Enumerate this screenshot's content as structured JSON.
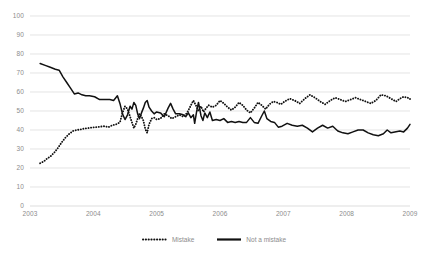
{
  "chart_data": {
    "type": "line",
    "title": "",
    "xlabel": "",
    "ylabel": "",
    "ylim": [
      0,
      100
    ],
    "xlim": [
      2003.0,
      2009.0
    ],
    "ytick_labels": [
      "100",
      "90",
      "80",
      "70",
      "60",
      "50",
      "40",
      "30",
      "20",
      "10",
      "0"
    ],
    "ytick_values": [
      100,
      90,
      80,
      70,
      60,
      50,
      40,
      30,
      20,
      10,
      0
    ],
    "xtick_labels": [
      "2003",
      "2004",
      "2005",
      "2006",
      "2007",
      "2008",
      "2009"
    ],
    "xtick_values": [
      2003,
      2004,
      2005,
      2006,
      2007,
      2008,
      2009
    ],
    "grid": "horizontal",
    "legend_position": "bottom-center",
    "series": [
      {
        "name": "Mistake",
        "style": "dotted",
        "color": "#111111",
        "points": [
          [
            2003.16,
            22.5
          ],
          [
            2003.22,
            23.5
          ],
          [
            2003.27,
            25.0
          ],
          [
            2003.32,
            26.0
          ],
          [
            2003.38,
            28.0
          ],
          [
            2003.44,
            30.5
          ],
          [
            2003.5,
            33.5
          ],
          [
            2003.56,
            36.0
          ],
          [
            2003.62,
            38.0
          ],
          [
            2003.68,
            39.5
          ],
          [
            2003.74,
            40.0
          ],
          [
            2003.8,
            40.3
          ],
          [
            2003.86,
            40.8
          ],
          [
            2003.92,
            41.0
          ],
          [
            2003.98,
            41.3
          ],
          [
            2004.05,
            41.5
          ],
          [
            2004.12,
            41.8
          ],
          [
            2004.18,
            42.0
          ],
          [
            2004.24,
            41.5
          ],
          [
            2004.3,
            42.5
          ],
          [
            2004.36,
            43.0
          ],
          [
            2004.42,
            44.0
          ],
          [
            2004.46,
            49.0
          ],
          [
            2004.5,
            52.5
          ],
          [
            2004.54,
            51.0
          ],
          [
            2004.58,
            47.0
          ],
          [
            2004.61,
            44.0
          ],
          [
            2004.64,
            41.0
          ],
          [
            2004.67,
            43.0
          ],
          [
            2004.7,
            46.0
          ],
          [
            2004.73,
            48.5
          ],
          [
            2004.76,
            47.0
          ],
          [
            2004.79,
            45.0
          ],
          [
            2004.82,
            40.5
          ],
          [
            2004.85,
            38.5
          ],
          [
            2004.88,
            43.0
          ],
          [
            2004.92,
            46.0
          ],
          [
            2004.96,
            46.5
          ],
          [
            2005.0,
            45.5
          ],
          [
            2005.06,
            46.0
          ],
          [
            2005.12,
            48.5
          ],
          [
            2005.18,
            47.5
          ],
          [
            2005.24,
            46.0
          ],
          [
            2005.3,
            47.0
          ],
          [
            2005.36,
            48.0
          ],
          [
            2005.42,
            47.0
          ],
          [
            2005.48,
            49.0
          ],
          [
            2005.54,
            53.0
          ],
          [
            2005.58,
            55.5
          ],
          [
            2005.62,
            53.0
          ],
          [
            2005.66,
            50.0
          ],
          [
            2005.7,
            52.5
          ],
          [
            2005.74,
            49.5
          ],
          [
            2005.78,
            51.5
          ],
          [
            2005.82,
            53.0
          ],
          [
            2005.88,
            52.0
          ],
          [
            2005.94,
            53.0
          ],
          [
            2006.0,
            55.5
          ],
          [
            2006.06,
            54.0
          ],
          [
            2006.12,
            52.0
          ],
          [
            2006.18,
            50.5
          ],
          [
            2006.24,
            52.0
          ],
          [
            2006.3,
            54.5
          ],
          [
            2006.36,
            53.0
          ],
          [
            2006.42,
            50.5
          ],
          [
            2006.48,
            49.0
          ],
          [
            2006.54,
            51.5
          ],
          [
            2006.6,
            54.5
          ],
          [
            2006.66,
            53.0
          ],
          [
            2006.72,
            51.0
          ],
          [
            2006.78,
            53.5
          ],
          [
            2006.84,
            55.0
          ],
          [
            2006.9,
            54.5
          ],
          [
            2006.96,
            53.5
          ],
          [
            2007.02,
            55.0
          ],
          [
            2007.1,
            56.5
          ],
          [
            2007.18,
            55.5
          ],
          [
            2007.26,
            54.0
          ],
          [
            2007.34,
            56.5
          ],
          [
            2007.42,
            58.5
          ],
          [
            2007.5,
            57.0
          ],
          [
            2007.58,
            55.0
          ],
          [
            2007.66,
            53.5
          ],
          [
            2007.74,
            55.5
          ],
          [
            2007.82,
            57.0
          ],
          [
            2007.9,
            56.0
          ],
          [
            2007.98,
            55.0
          ],
          [
            2008.06,
            56.0
          ],
          [
            2008.14,
            57.0
          ],
          [
            2008.22,
            56.0
          ],
          [
            2008.3,
            55.0
          ],
          [
            2008.38,
            54.0
          ],
          [
            2008.46,
            55.5
          ],
          [
            2008.54,
            58.5
          ],
          [
            2008.62,
            58.0
          ],
          [
            2008.7,
            56.5
          ],
          [
            2008.78,
            55.0
          ],
          [
            2008.84,
            56.5
          ],
          [
            2008.9,
            57.5
          ],
          [
            2008.96,
            57.0
          ],
          [
            2009.0,
            56.5
          ],
          [
            2009.0,
            56.0
          ]
        ]
      },
      {
        "name": "Not a mistake",
        "style": "solid",
        "color": "#111111",
        "points": [
          [
            2003.16,
            75.0
          ],
          [
            2003.24,
            74.0
          ],
          [
            2003.32,
            73.0
          ],
          [
            2003.4,
            72.0
          ],
          [
            2003.46,
            71.5
          ],
          [
            2003.52,
            68.0
          ],
          [
            2003.58,
            65.0
          ],
          [
            2003.64,
            62.0
          ],
          [
            2003.7,
            59.0
          ],
          [
            2003.76,
            59.5
          ],
          [
            2003.82,
            58.5
          ],
          [
            2003.88,
            58.0
          ],
          [
            2003.94,
            58.0
          ],
          [
            2004.02,
            57.5
          ],
          [
            2004.1,
            56.0
          ],
          [
            2004.18,
            56.0
          ],
          [
            2004.26,
            56.0
          ],
          [
            2004.32,
            55.5
          ],
          [
            2004.38,
            58.0
          ],
          [
            2004.42,
            54.0
          ],
          [
            2004.46,
            48.5
          ],
          [
            2004.5,
            45.5
          ],
          [
            2004.54,
            48.0
          ],
          [
            2004.58,
            52.5
          ],
          [
            2004.61,
            51.0
          ],
          [
            2004.64,
            54.5
          ],
          [
            2004.67,
            53.0
          ],
          [
            2004.7,
            48.5
          ],
          [
            2004.73,
            46.0
          ],
          [
            2004.76,
            49.0
          ],
          [
            2004.79,
            51.5
          ],
          [
            2004.82,
            54.5
          ],
          [
            2004.85,
            55.5
          ],
          [
            2004.88,
            52.0
          ],
          [
            2004.92,
            50.0
          ],
          [
            2004.96,
            48.5
          ],
          [
            2005.0,
            49.5
          ],
          [
            2005.06,
            49.0
          ],
          [
            2005.12,
            47.0
          ],
          [
            2005.18,
            51.5
          ],
          [
            2005.22,
            54.0
          ],
          [
            2005.26,
            51.0
          ],
          [
            2005.3,
            48.5
          ],
          [
            2005.36,
            48.5
          ],
          [
            2005.42,
            48.0
          ],
          [
            2005.46,
            47.0
          ],
          [
            2005.5,
            49.0
          ],
          [
            2005.54,
            46.5
          ],
          [
            2005.58,
            48.0
          ],
          [
            2005.6,
            43.5
          ],
          [
            2005.63,
            49.5
          ],
          [
            2005.66,
            54.5
          ],
          [
            2005.7,
            47.5
          ],
          [
            2005.73,
            45.0
          ],
          [
            2005.76,
            49.0
          ],
          [
            2005.8,
            46.5
          ],
          [
            2005.84,
            49.5
          ],
          [
            2005.88,
            45.0
          ],
          [
            2005.94,
            45.5
          ],
          [
            2006.0,
            45.0
          ],
          [
            2006.06,
            46.0
          ],
          [
            2006.12,
            44.0
          ],
          [
            2006.18,
            44.5
          ],
          [
            2006.24,
            44.0
          ],
          [
            2006.3,
            44.5
          ],
          [
            2006.36,
            44.0
          ],
          [
            2006.42,
            44.0
          ],
          [
            2006.48,
            46.5
          ],
          [
            2006.54,
            44.0
          ],
          [
            2006.6,
            43.5
          ],
          [
            2006.66,
            47.5
          ],
          [
            2006.7,
            50.0
          ],
          [
            2006.74,
            46.0
          ],
          [
            2006.8,
            44.5
          ],
          [
            2006.86,
            44.0
          ],
          [
            2006.92,
            41.5
          ],
          [
            2006.98,
            42.0
          ],
          [
            2007.06,
            43.5
          ],
          [
            2007.14,
            42.5
          ],
          [
            2007.22,
            42.0
          ],
          [
            2007.3,
            42.5
          ],
          [
            2007.38,
            41.0
          ],
          [
            2007.46,
            39.0
          ],
          [
            2007.54,
            41.0
          ],
          [
            2007.62,
            42.5
          ],
          [
            2007.7,
            41.0
          ],
          [
            2007.78,
            42.0
          ],
          [
            2007.86,
            39.5
          ],
          [
            2007.94,
            38.5
          ],
          [
            2008.02,
            38.0
          ],
          [
            2008.1,
            39.0
          ],
          [
            2008.18,
            40.0
          ],
          [
            2008.26,
            40.0
          ],
          [
            2008.34,
            38.5
          ],
          [
            2008.42,
            37.5
          ],
          [
            2008.5,
            37.0
          ],
          [
            2008.58,
            38.0
          ],
          [
            2008.64,
            40.0
          ],
          [
            2008.7,
            38.5
          ],
          [
            2008.76,
            39.0
          ],
          [
            2008.84,
            39.5
          ],
          [
            2008.9,
            39.0
          ],
          [
            2008.96,
            41.0
          ],
          [
            2009.0,
            43.0
          ]
        ]
      }
    ]
  },
  "legend": {
    "entries": [
      {
        "label": "Mistake",
        "style": "dotted"
      },
      {
        "label": "Not a mistake",
        "style": "solid"
      }
    ]
  }
}
